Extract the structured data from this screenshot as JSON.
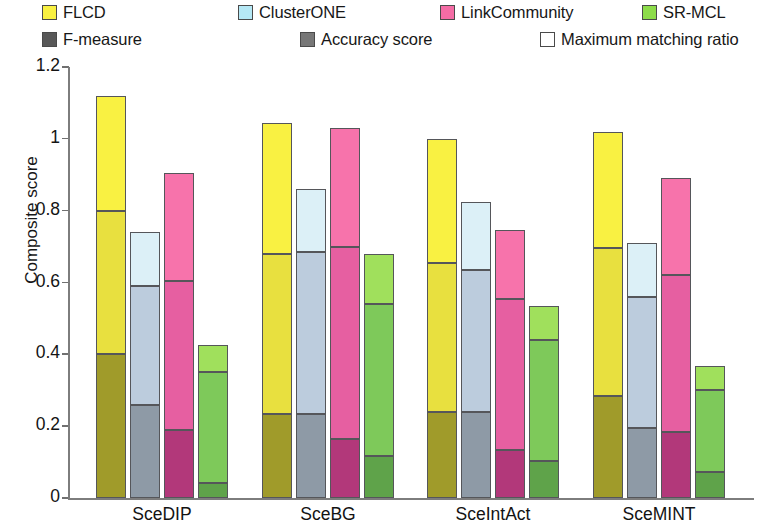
{
  "chart_data": {
    "type": "bar",
    "subtype": "grouped-stacked",
    "title": "",
    "xlabel": "",
    "ylabel": "Composite score",
    "ylim": [
      0,
      1.2
    ],
    "yticks": [
      "0",
      "0.2",
      "0.4",
      "0.6",
      "0.8",
      "1",
      "1.2"
    ],
    "ytick_values": [
      0,
      0.2,
      0.4,
      0.6,
      0.8,
      1.0,
      1.2
    ],
    "grid": false,
    "legend_position": "top",
    "categories": [
      "SceDIP",
      "SceBG",
      "SceIntAct",
      "SceMINT"
    ],
    "methods": [
      "FLCD",
      "ClusterONE",
      "LinkCommunity",
      "SR-MCL"
    ],
    "stack_components": [
      "F-measure",
      "Accuracy score",
      "Maximum matching ratio"
    ],
    "method_colors": {
      "FLCD": "#f9f142",
      "ClusterONE": "#b5e8f5",
      "LinkCommunity": "#f46ca5",
      "SR-MCL": "#8ddc4a"
    },
    "component_colors": {
      "F-measure": "#585858",
      "Accuracy score": "#777777",
      "Maximum matching ratio": "#ffffff"
    },
    "segment_fills": {
      "FLCD": {
        "F-measure": "#a09b2a",
        "Accuracy score": "#e8e03f",
        "Maximum matching ratio": "#f9f142"
      },
      "ClusterONE": {
        "F-measure": "#8e9aa6",
        "Accuracy score": "#bcccdd",
        "Maximum matching ratio": "#dcf0f7"
      },
      "LinkCommunity": {
        "F-measure": "#b2387a",
        "Accuracy score": "#e65fa1",
        "Maximum matching ratio": "#f773ab"
      },
      "SR-MCL": {
        "F-measure": "#5fa34a",
        "Accuracy score": "#7ec95a",
        "Maximum matching ratio": "#a0e05c"
      }
    },
    "series": [
      {
        "name": "F-measure",
        "values_by_method": {
          "FLCD": [
            0.4,
            0.235,
            0.24,
            0.285
          ],
          "ClusterONE": [
            0.26,
            0.235,
            0.24,
            0.195
          ],
          "LinkCommunity": [
            0.19,
            0.165,
            0.135,
            0.185
          ],
          "SR-MCL": [
            0.042,
            0.118,
            0.102,
            0.072
          ]
        }
      },
      {
        "name": "Accuracy score",
        "cumulative_top_by_method": {
          "FLCD": [
            0.8,
            0.68,
            0.655,
            0.695
          ],
          "ClusterONE": [
            0.59,
            0.685,
            0.635,
            0.56
          ],
          "LinkCommunity": [
            0.605,
            0.7,
            0.553,
            0.62
          ],
          "SR-MCL": [
            0.35,
            0.54,
            0.44,
            0.3
          ]
        }
      },
      {
        "name": "Maximum matching ratio",
        "cumulative_top_by_method": {
          "FLCD": [
            1.12,
            1.045,
            1.0,
            1.02
          ],
          "ClusterONE": [
            0.74,
            0.86,
            0.825,
            0.71
          ],
          "LinkCommunity": [
            0.905,
            1.03,
            0.745,
            0.89
          ],
          "SR-MCL": [
            0.425,
            0.68,
            0.535,
            0.368
          ]
        }
      }
    ]
  },
  "legend": {
    "row1": [
      {
        "label": "FLCD",
        "color": "#f9f142"
      },
      {
        "label": "ClusterONE",
        "color": "#b5e8f5"
      },
      {
        "label": "LinkCommunity",
        "color": "#f46ca5"
      },
      {
        "label": "SR-MCL",
        "color": "#8ddc4a"
      }
    ],
    "row2": [
      {
        "label": "F-measure",
        "color": "#585858"
      },
      {
        "label": "Accuracy score",
        "color": "#777777"
      },
      {
        "label": "Maximum matching ratio",
        "color": "#ffffff"
      }
    ]
  },
  "axes": {
    "ylabel": "Composite score",
    "ytick_labels": [
      "1.2",
      "1",
      "0.8",
      "0.6",
      "0.4",
      "0.2",
      "0"
    ],
    "xtick_labels": [
      "SceDIP",
      "SceBG",
      "SceIntAct",
      "SceMINT"
    ]
  }
}
